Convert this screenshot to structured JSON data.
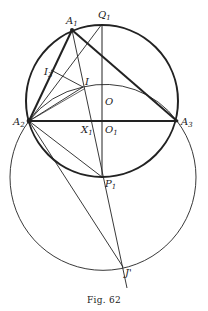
{
  "figure": {
    "caption": "Fig. 62",
    "colors": {
      "ink": "#222222",
      "background": "#ffffff"
    },
    "points": {
      "A1": {
        "label": "A",
        "sub": "1",
        "x": 72,
        "y": 30
      },
      "A2": {
        "label": "A",
        "sub": "2",
        "x": 29,
        "y": 121
      },
      "A3": {
        "label": "A",
        "sub": "3",
        "x": 177,
        "y": 121
      },
      "Q1": {
        "label": "Q",
        "sub": "1",
        "x": 102,
        "y": 24
      },
      "I3": {
        "label": "I",
        "sub": "3",
        "x": 51,
        "y": 70
      },
      "I": {
        "label": "I",
        "sub": "",
        "x": 83,
        "y": 87
      },
      "O": {
        "label": "O",
        "sub": "",
        "x": 102,
        "y": 101
      },
      "O1": {
        "label": "O",
        "sub": "1",
        "x": 102,
        "y": 121
      },
      "X1": {
        "label": "X",
        "sub": "1",
        "x": 89,
        "y": 121
      },
      "P1": {
        "label": "P",
        "sub": "1",
        "x": 102,
        "y": 177
      },
      "J'": {
        "label": "J'",
        "sub": "",
        "x": 123,
        "y": 267
      }
    },
    "circles": [
      {
        "name": "circumcircle",
        "cx": 102,
        "cy": 101,
        "r": 76,
        "weight": "bold"
      },
      {
        "name": "large-circle",
        "cx": 102,
        "cy": 177,
        "r": 93,
        "weight": "thin"
      },
      {
        "name": "arc-through-I",
        "cx": 102,
        "cy": 175,
        "r": 90,
        "weight": "thin"
      }
    ]
  }
}
